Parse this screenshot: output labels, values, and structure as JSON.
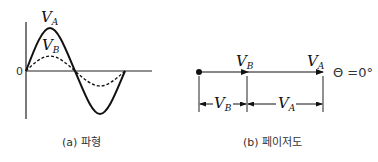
{
  "panel_a": {
    "caption": "(a) 파형",
    "origin_label": "0",
    "curves": [
      {
        "name": "V",
        "subscript": "A",
        "style": "solid",
        "amplitude": 1.0
      },
      {
        "name": "V",
        "subscript": "B",
        "style": "dashed",
        "amplitude": 0.35
      }
    ]
  },
  "panel_b": {
    "caption": "(b) 페이저도",
    "vector_labels": [
      {
        "name": "V",
        "subscript": "B"
      },
      {
        "name": "V",
        "subscript": "A"
      }
    ],
    "dimension_labels": [
      {
        "name": "V",
        "subscript": "B"
      },
      {
        "name": "V",
        "subscript": "A"
      }
    ],
    "angle_label": "Θ =0°"
  }
}
